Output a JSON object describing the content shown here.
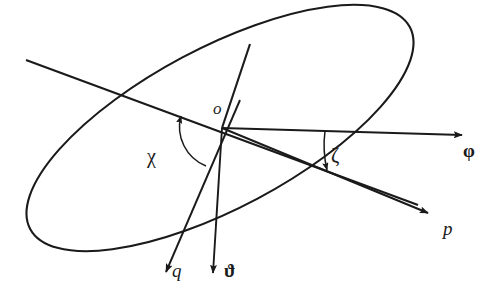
{
  "figure": {
    "type": "geometric-diagram",
    "background_color": "#ffffff",
    "stroke_color": "#1a1a1a"
  },
  "labels": {
    "origin": "o",
    "phi": "φ",
    "p": "p",
    "q": "q",
    "theta": "ϑ",
    "chi": "χ",
    "zeta": "ζ"
  },
  "geometry": {
    "origin": {
      "x": 222,
      "y": 128
    },
    "ellipse": {
      "center_x": 220,
      "center_y": 128,
      "radius_x": 215,
      "radius_y": 80,
      "rotation_deg": -28
    },
    "axes": [
      {
        "name": "phi-axis",
        "label": "φ",
        "tip_x": 467,
        "tip_y": 135
      },
      {
        "name": "p-axis",
        "label": "p",
        "tip_x": 433,
        "tip_y": 215
      },
      {
        "name": "q-axis",
        "label": "q",
        "tip_x": 163,
        "tip_y": 275
      },
      {
        "name": "theta-axis",
        "label": "ϑ",
        "tip_x": 212,
        "tip_y": 277
      }
    ],
    "chords": [
      {
        "name": "major-axis-chord",
        "x1": 26,
        "y1": 60,
        "x2": 418,
        "y2": 205
      },
      {
        "name": "minor-axis-chord",
        "x1": 250,
        "y1": 44,
        "x2": 222,
        "y2": 128
      }
    ],
    "angles": [
      {
        "name": "chi-angle",
        "label": "χ",
        "from": "q-axis",
        "to": "major-axis-chord"
      },
      {
        "name": "zeta-angle",
        "label": "ζ",
        "from": "phi-axis",
        "to": "p-axis"
      }
    ]
  }
}
